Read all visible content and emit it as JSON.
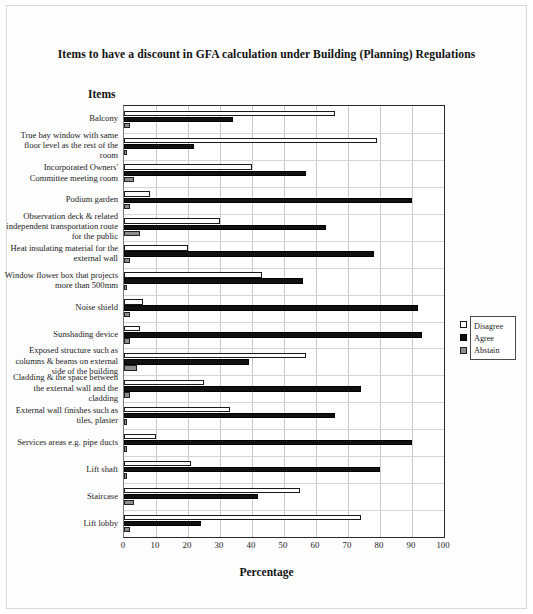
{
  "chart_title": "Items to have a discount in GFA calculation under Building (Planning) Regulations",
  "items_heading": "Items",
  "xaxis_title": "Percentage",
  "legend": {
    "disagree": "Disagree",
    "agree": "Agree",
    "abstain": "Abstain"
  },
  "colors": {
    "disagree": "#ffffff",
    "agree": "#111111",
    "abstain": "#8d8d8d",
    "axis": "#2a2a2a",
    "grid": "#c9c9c9"
  },
  "chart_data": {
    "type": "bar",
    "orientation": "horizontal",
    "title": "Items to have a discount in GFA calculation under Building (Planning) Regulations",
    "xlabel": "Percentage",
    "ylabel": "Items",
    "xlim": [
      0,
      100
    ],
    "xticks": [
      0,
      10,
      20,
      30,
      40,
      50,
      60,
      70,
      80,
      90,
      100
    ],
    "grid": true,
    "legend_position": "right",
    "categories": [
      "Balcony",
      "True bay window with same floor level as the rest of the room",
      "Incorporated Owners' Committee meeting room",
      "Podium garden",
      "Observation deck & related independent transportation route for the public",
      "Heat insulating material for the external wall",
      "Window flower box that projects more than 500mm",
      "Noise shield",
      "Sunshading device",
      "Exposed structure such as columns & beams on external side of the building",
      "Cladding & the space between the external wall and the cladding",
      "External wall finishes such as tiles, plaster",
      "Services areas e.g. pipe ducts",
      "Lift shaft",
      "Staircase",
      "Lift lobby"
    ],
    "series": [
      {
        "name": "Disagree",
        "values": [
          66,
          79,
          40,
          8,
          30,
          20,
          43,
          6,
          5,
          57,
          25,
          33,
          10,
          21,
          55,
          74
        ]
      },
      {
        "name": "Agree",
        "values": [
          34,
          22,
          57,
          90,
          63,
          78,
          56,
          92,
          93,
          39,
          74,
          66,
          90,
          80,
          42,
          24
        ]
      },
      {
        "name": "Abstain",
        "values": [
          2,
          1,
          3,
          2,
          5,
          2,
          1,
          2,
          2,
          4,
          2,
          1,
          1,
          1,
          3,
          2
        ]
      }
    ]
  }
}
